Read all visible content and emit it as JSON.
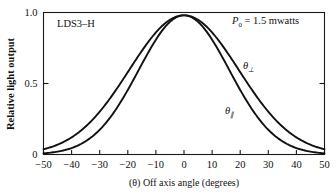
{
  "figure": {
    "device_label": "LDS3–H",
    "power_annotation": "P",
    "power_annotation_sub": "0",
    "power_annotation_rest": " = 1.5 mwatts",
    "y_axis_title": "Relative light output",
    "x_axis_title": "(θ) Off axis angle (degrees)",
    "curve_label_perp_symbol": "θ",
    "curve_label_perp_sub": "⊥",
    "curve_label_par_symbol": "θ",
    "curve_label_par_sub": "∥"
  },
  "chart_data": {
    "type": "line",
    "xlabel": "(θ) Off axis angle (degrees)",
    "ylabel": "Relative light output",
    "xlim": [
      -50,
      50
    ],
    "ylim": [
      0,
      1.0
    ],
    "xticks": [
      -50,
      -40,
      -30,
      -20,
      -10,
      0,
      10,
      20,
      30,
      40,
      50
    ],
    "xticklabels": [
      "−50",
      "−40",
      "−30",
      "−20",
      "−10",
      "0",
      "10",
      "20",
      "30",
      "40",
      "50"
    ],
    "yticks": [
      0,
      0.5,
      1.0
    ],
    "yticklabels": [
      "0",
      "0.5",
      "1.0"
    ],
    "grid": false,
    "legend": "inline-annotation",
    "annotations": [
      {
        "text": "LDS3–H",
        "x": -43,
        "y": 0.92
      },
      {
        "text": "P0 = 1.5 mwatts",
        "x": 30,
        "y": 0.93
      },
      {
        "text": "θ⊥",
        "x": 22,
        "y": 0.62
      },
      {
        "text": "θ∥",
        "x": 16,
        "y": 0.37
      }
    ],
    "x": [
      -50,
      -45,
      -40,
      -35,
      -30,
      -25,
      -20,
      -15,
      -10,
      -5,
      0,
      5,
      10,
      15,
      20,
      25,
      30,
      35,
      40,
      45,
      50
    ],
    "series": [
      {
        "name": "θ⊥",
        "fwhm_degrees": 46,
        "peak": 0.98,
        "values": [
          0.07,
          0.11,
          0.16,
          0.23,
          0.32,
          0.43,
          0.55,
          0.68,
          0.81,
          0.93,
          0.98,
          0.93,
          0.81,
          0.68,
          0.55,
          0.43,
          0.32,
          0.23,
          0.16,
          0.11,
          0.07
        ]
      },
      {
        "name": "θ∥",
        "fwhm_degrees": 38,
        "peak": 0.98,
        "values": [
          0.025,
          0.045,
          0.075,
          0.125,
          0.195,
          0.29,
          0.41,
          0.56,
          0.72,
          0.89,
          0.98,
          0.89,
          0.72,
          0.56,
          0.41,
          0.29,
          0.195,
          0.125,
          0.075,
          0.045,
          0.025
        ]
      }
    ]
  },
  "colors": {
    "curve": "#111111",
    "axis": "#1a1a1a",
    "background": "#ffffff"
  }
}
